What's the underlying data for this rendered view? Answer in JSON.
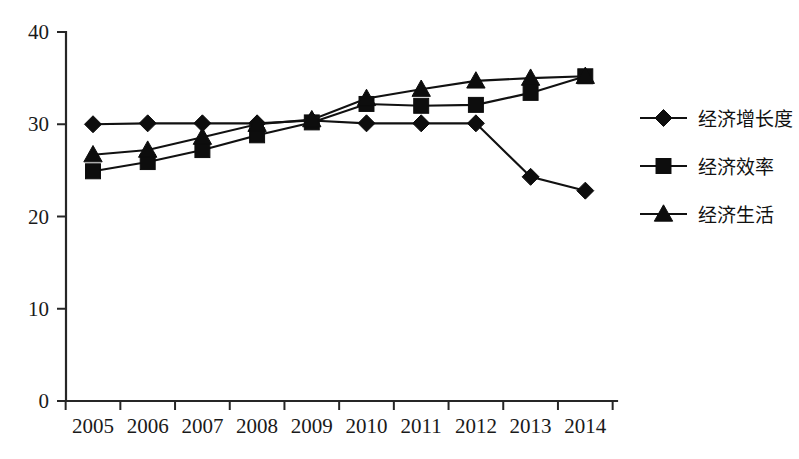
{
  "chart_data": {
    "type": "line",
    "title": "",
    "subtitle": "",
    "xlabel": "",
    "ylabel": "",
    "categories": [
      "2005",
      "2006",
      "2007",
      "2008",
      "2009",
      "2010",
      "2011",
      "2012",
      "2013",
      "2014"
    ],
    "ylim": [
      0,
      40
    ],
    "yticks": [
      0,
      10,
      20,
      30,
      40
    ],
    "ytick_labels": [
      "0",
      "10",
      "20",
      "30",
      "40"
    ],
    "grid": false,
    "legend_position": "right",
    "series": [
      {
        "name": "经济增长度",
        "marker": "diamond",
        "color": "#111111",
        "values": [
          30.0,
          30.1,
          30.1,
          30.1,
          30.4,
          30.1,
          30.1,
          30.1,
          24.3,
          22.8
        ]
      },
      {
        "name": "经济效率",
        "marker": "square",
        "color": "#111111",
        "values": [
          24.9,
          25.9,
          27.2,
          28.8,
          30.2,
          32.2,
          32.0,
          32.1,
          33.4,
          35.2
        ]
      },
      {
        "name": "经济生活",
        "marker": "triangle",
        "color": "#111111",
        "values": [
          26.7,
          27.2,
          28.6,
          30.0,
          30.5,
          32.8,
          33.8,
          34.7,
          35.0,
          35.2
        ]
      }
    ]
  },
  "legend": {
    "items": [
      {
        "label": "经济增长度",
        "marker": "diamond"
      },
      {
        "label": "经济效率",
        "marker": "square"
      },
      {
        "label": "经济生活",
        "marker": "triangle"
      }
    ]
  },
  "axes": {
    "y_labels": [
      "40",
      "30",
      "20",
      "10",
      "0"
    ],
    "x_labels": [
      "2005",
      "2006",
      "2007",
      "2008",
      "2009",
      "2010",
      "2011",
      "2012",
      "2013",
      "2014"
    ]
  }
}
